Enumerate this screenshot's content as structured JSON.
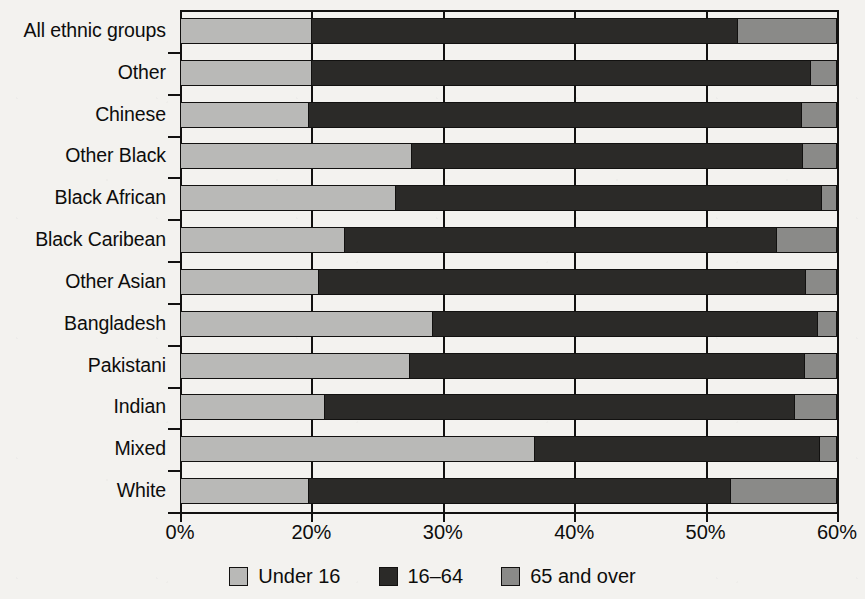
{
  "chart_data": {
    "type": "bar",
    "orientation": "horizontal",
    "stacked": true,
    "title": "",
    "subtitle": "",
    "xlabel": "",
    "ylabel": "",
    "grid": true,
    "legend_position": "bottom",
    "xlim": [
      0,
      60
    ],
    "x_axis_note": "Broken axis: 0% to 20% occupies the same pixel span as each later 10% step",
    "xticks": [
      0,
      20,
      30,
      40,
      50,
      60
    ],
    "xticklabels": [
      "0%",
      "20%",
      "30%",
      "40%",
      "50%",
      "60%"
    ],
    "categories": [
      "All ethnic groups",
      "Other",
      "Chinese",
      "Other Black",
      "Black African",
      "Black Caribean",
      "Other Asian",
      "Bangladesh",
      "Pakistani",
      "Indian",
      "Mixed",
      "White"
    ],
    "series": [
      {
        "name": "Under 16",
        "color": "#b9b9b7",
        "values": [
          20.0,
          20.0,
          19.5,
          27.6,
          26.4,
          22.5,
          20.5,
          29.2,
          27.5,
          21.0,
          37.0,
          19.5
        ]
      },
      {
        "name": "16–64",
        "color": "#2b2a28",
        "values": [
          32.5,
          38.1,
          37.9,
          29.9,
          32.5,
          33.0,
          37.2,
          29.4,
          30.1,
          35.9,
          21.8,
          32.5
        ]
      },
      {
        "name": "65 and over",
        "color": "#8a8a88",
        "values": [
          7.5,
          1.9,
          2.6,
          2.5,
          1.1,
          4.5,
          2.3,
          1.4,
          2.4,
          3.1,
          1.2,
          8.0
        ]
      }
    ],
    "cumulative_boundaries_percent": [
      [
        20.0,
        52.5
      ],
      [
        20.0,
        58.1
      ],
      [
        19.5,
        57.4
      ],
      [
        27.6,
        57.5
      ],
      [
        26.4,
        58.9
      ],
      [
        22.5,
        55.5
      ],
      [
        20.5,
        57.7
      ],
      [
        29.2,
        58.6
      ],
      [
        27.5,
        57.6
      ],
      [
        21.0,
        56.9
      ],
      [
        37.0,
        58.8
      ],
      [
        19.5,
        52.0
      ]
    ],
    "bar_total_percent": 60
  },
  "legend": {
    "items": [
      {
        "label": "Under 16",
        "swatch": "light-gray-swatch-icon"
      },
      {
        "label": "16–64",
        "swatch": "dark-swatch-icon"
      },
      {
        "label": "65 and over",
        "swatch": "mid-gray-swatch-icon"
      }
    ]
  },
  "colors": {
    "under16": "#b9b9b7",
    "age16to64": "#2b2a28",
    "age65plus": "#8a8a88",
    "axis": "#121110",
    "background": "#f3f2ef"
  }
}
